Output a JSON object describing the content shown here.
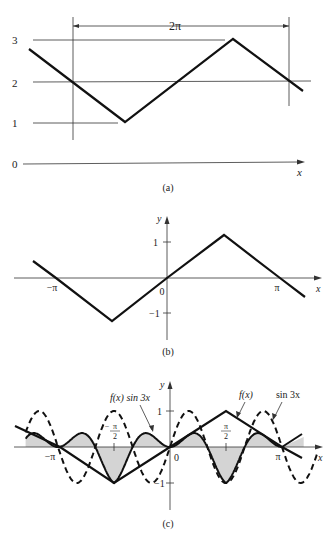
{
  "figure": {
    "panels": [
      {
        "id": "a",
        "caption": "(a)",
        "span_label": "2π",
        "x_label": "x",
        "y_ticks": [
          "0",
          "1",
          "2",
          "3"
        ]
      },
      {
        "id": "b",
        "caption": "(b)",
        "x_label": "x",
        "y_label": "y",
        "x_ticks": [
          "−π",
          "0",
          "π"
        ],
        "y_ticks": [
          "1",
          "−1"
        ]
      },
      {
        "id": "c",
        "caption": "(c)",
        "x_label": "x",
        "y_label": "y",
        "x_ticks": [
          "−π",
          "−π/2",
          "0",
          "π/2",
          "π"
        ],
        "y_ticks": [
          "1",
          "−1"
        ],
        "x_tick_num": "π",
        "x_tick_den": "2",
        "x_tick_neg": "−",
        "annotations": [
          "f(x) sin 3x",
          "f(x)",
          "sin 3x"
        ]
      }
    ]
  },
  "chart_data": [
    {
      "type": "line",
      "title": "(a) Periodic triangular function with period 2π, oscillating between 1 and 3",
      "xlabel": "x",
      "ylabel": "",
      "ylim": [
        0,
        3
      ],
      "annotation": "2π (period span)",
      "series": [
        {
          "name": "triangle wave",
          "x_px": [
            29,
            125,
            233,
            303
          ],
          "y": [
            2.8,
            1.0,
            3.0,
            1.75
          ]
        }
      ],
      "reference_lines": [
        {
          "y": 1
        },
        {
          "y": 2
        },
        {
          "y": 3
        }
      ]
    },
    {
      "type": "line",
      "title": "(b) Odd triangular function on [−π, π]",
      "xlabel": "x",
      "ylabel": "y",
      "xticks": [
        "−π",
        "0",
        "π"
      ],
      "yticks": [
        1,
        -1
      ],
      "series": [
        {
          "name": "f(x)",
          "x": [
            "-4.1",
            "-π",
            "-π/2",
            "0",
            "π/2",
            "π",
            "4.1"
          ],
          "y": [
            0.45,
            0,
            -1.2,
            0,
            1.2,
            0,
            -0.5
          ]
        }
      ]
    },
    {
      "type": "line",
      "title": "(c) f(x), sin 3x and product f(x) sin 3x (shaded)",
      "xlabel": "x",
      "ylabel": "y",
      "xticks": [
        "−π",
        "−π/2",
        "0",
        "π/2",
        "π"
      ],
      "yticks": [
        1,
        -1
      ],
      "series": [
        {
          "name": "f(x)",
          "style": "solid",
          "x": [
            "-4.1",
            "-π",
            "-π/2",
            "0",
            "π/2",
            "π",
            "4.1"
          ],
          "y": [
            0.6,
            0,
            -1,
            0,
            1,
            0,
            -0.6
          ]
        },
        {
          "name": "sin 3x",
          "style": "dashed",
          "amplitude": 1,
          "period": "2π/3"
        },
        {
          "name": "f(x) sin 3x",
          "style": "solid-shaded",
          "max": 0.4,
          "min": -1
        }
      ]
    }
  ]
}
